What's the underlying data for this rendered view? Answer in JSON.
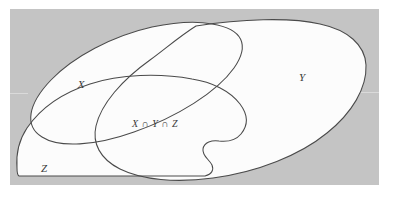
{
  "figure": {
    "kind": "venn-diagram",
    "caption": "",
    "canvas": {
      "width": 395,
      "height": 198
    },
    "colors": {
      "page_background": "#ffffff",
      "plate_background": "#c4c4c4",
      "set_fill": "#fcfcfc",
      "outline": "#4a4a4a",
      "label_text": "#3a3a3a"
    },
    "plate": {
      "x": 10,
      "y": 9,
      "width": 369,
      "height": 176
    }
  },
  "sets": [
    {
      "id": "set-x",
      "label": "X",
      "label_x": 81,
      "label_y": 88,
      "shape": "tilted-ellipse",
      "description": "rotated ellipse occupying upper-left through center"
    },
    {
      "id": "set-y",
      "label": "Y",
      "label_x": 302,
      "label_y": 81,
      "shape": "rounded-blob",
      "description": "large rounded region on the right side"
    },
    {
      "id": "set-z",
      "label": "Z",
      "label_x": 44,
      "label_y": 172,
      "shape": "flat-bottom-blob",
      "description": "lower blob with flat bottom edge and a concave wave on its right side"
    }
  ],
  "annotations": [
    {
      "id": "triple-intersection-label",
      "text": "X ∩ Y ∩ Z",
      "x": 155,
      "y": 127,
      "description": "label marking the common region of all three sets"
    }
  ]
}
